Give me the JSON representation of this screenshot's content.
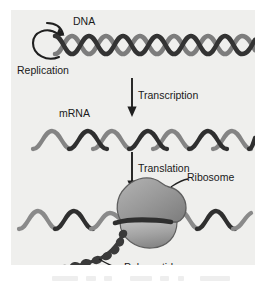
{
  "figure": {
    "kind": "central-dogma-diagram",
    "background_color": "#efefed",
    "page_color": "#ffffff",
    "ink_color": "#3b3b3b",
    "ink_dark_color": "#2b2b2b",
    "ribosome_color": "#8f8f8f",
    "text_color": "#1a1a1a"
  },
  "labels": {
    "dna": "DNA",
    "replication": "Replication",
    "transcription": "Transcription",
    "mrna": "mRNA",
    "translation": "Translation",
    "ribosome": "Ribosome",
    "polypeptide": "Polypeptide"
  },
  "icons": {
    "replication_loop": "circular-arrow-icon",
    "transcription_arrow": "down-arrow-icon",
    "translation_arrow": "down-arrow-icon",
    "dna_helix": "dna-double-helix-icon",
    "mrna_strand": "wavy-strand-icon",
    "ribosome_blob": "ribosome-icon",
    "polypeptide_chain": "bead-chain-icon",
    "ribosome_leader": "leader-line-icon",
    "polypeptide_leader": "leader-line-icon"
  },
  "caption": {
    "visible": false,
    "text": ""
  }
}
